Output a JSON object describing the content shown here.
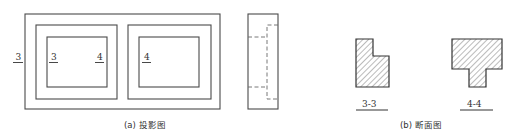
{
  "figure": {
    "projection": {
      "caption": "(a) 投影图",
      "front_view": {
        "labels": [
          {
            "id": "cut-3-left",
            "text": "3"
          },
          {
            "id": "cut-3-inner",
            "text": "3"
          },
          {
            "id": "cut-4-left-cell",
            "text": "4"
          },
          {
            "id": "cut-4-right-cell",
            "text": "4"
          }
        ]
      },
      "side_view": {
        "hidden_lines": "dashed"
      }
    },
    "sections": {
      "caption": "(b) 断面图",
      "items": [
        {
          "id": "section-3-3",
          "label": "3-3"
        },
        {
          "id": "section-4-4",
          "label": "4-4"
        }
      ]
    }
  },
  "colors": {
    "line": "#4a4a4a",
    "hatch": "#555555",
    "text": "#333333",
    "background": "#ffffff"
  }
}
